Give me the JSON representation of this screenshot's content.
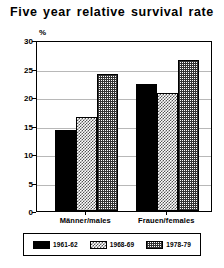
{
  "chart_data": {
    "type": "bar",
    "title": "Five year relative survival rate",
    "xlabel": "",
    "ylabel": "%",
    "ylim": [
      0,
      30
    ],
    "yticks": [
      0,
      5,
      10,
      15,
      20,
      25,
      30
    ],
    "ytick_labels": [
      "0",
      "5",
      "10",
      "15",
      "20",
      "25",
      "30"
    ],
    "grid": true,
    "legend_position": "bottom",
    "categories": [
      "Männer/males",
      "Frauen/females"
    ],
    "series": [
      {
        "name": "1961-62",
        "values": [
          14.3,
          22.3
        ],
        "fill": "solid-black"
      },
      {
        "name": "1968-69",
        "values": [
          16.5,
          20.7
        ],
        "fill": "light-checker"
      },
      {
        "name": "1978-79",
        "values": [
          24.0,
          26.5
        ],
        "fill": "dense-grid"
      }
    ]
  },
  "legend": {
    "items": [
      {
        "label": "1961-62"
      },
      {
        "label": "1968-69"
      },
      {
        "label": "1978-79"
      }
    ]
  },
  "colors": {
    "series1": "#000000",
    "axis": "#000000",
    "gridline": "#b8b8b8",
    "background": "#ffffff"
  }
}
